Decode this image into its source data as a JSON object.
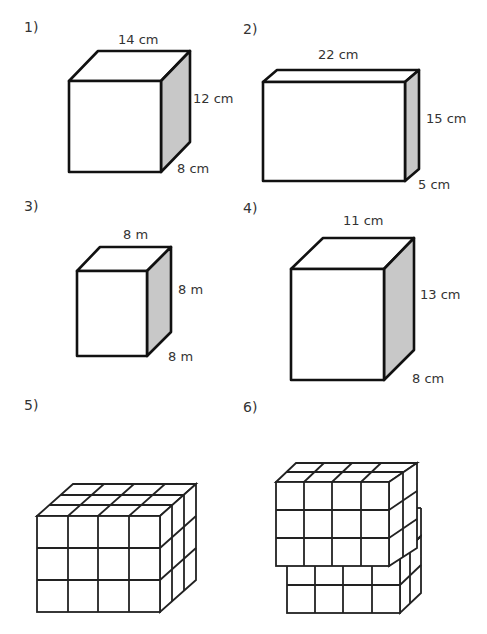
{
  "problems": [
    {
      "number": "1)",
      "length": "14 cm",
      "height": "12 cm",
      "depth": "8 cm"
    },
    {
      "number": "2)",
      "length": "22 cm",
      "height": "15 cm",
      "depth": "5 cm"
    },
    {
      "number": "3)",
      "length": "8 m",
      "height": "8 m",
      "depth": "8 m"
    },
    {
      "number": "4)",
      "length": "11 cm",
      "height": "13 cm",
      "depth": "8 cm"
    },
    {
      "number": "5)",
      "cubes": {
        "columns": 4,
        "rows": 3,
        "layers": 3
      }
    },
    {
      "number": "6)",
      "cubes": {
        "upper": {
          "columns": 4,
          "rows": 3,
          "layers": 2
        },
        "lower": {
          "columns": 4,
          "rows": 2,
          "layers": 2
        }
      }
    }
  ],
  "colors": {
    "line": "#111111",
    "side_shade": "#c8c8c8",
    "background": "#ffffff"
  }
}
